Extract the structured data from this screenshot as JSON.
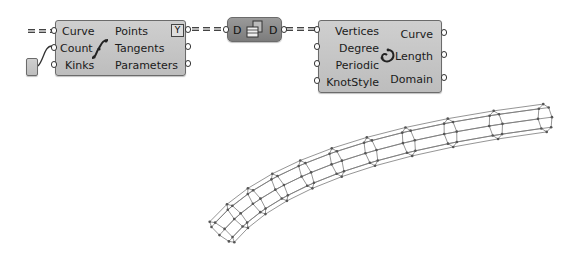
{
  "canvas": {
    "background": "#ffffff"
  },
  "components": [
    {
      "name": "Divide Curve",
      "icon": "divide-curve-icon",
      "inputs": [
        "Curve",
        "Count",
        "Kinks"
      ],
      "outputs": [
        "Points",
        "Tangents",
        "Parameters"
      ],
      "flag_icon": "graft-flatten-icon",
      "flag_glyph": "Y"
    },
    {
      "name": "Relay / Data",
      "icon": "data-table-icon",
      "input": "D",
      "output": "D"
    },
    {
      "name": "Interpolate",
      "icon": "interpolate-curve-icon",
      "inputs": [
        "Vertices",
        "Degree",
        "Periodic",
        "KnotStyle"
      ],
      "outputs": [
        "Curve",
        "Length",
        "Domain"
      ]
    }
  ],
  "viewport": {
    "object": "wireframe-pipe",
    "colors": {
      "wire": "#7a7a7a",
      "point": "#555555"
    }
  }
}
